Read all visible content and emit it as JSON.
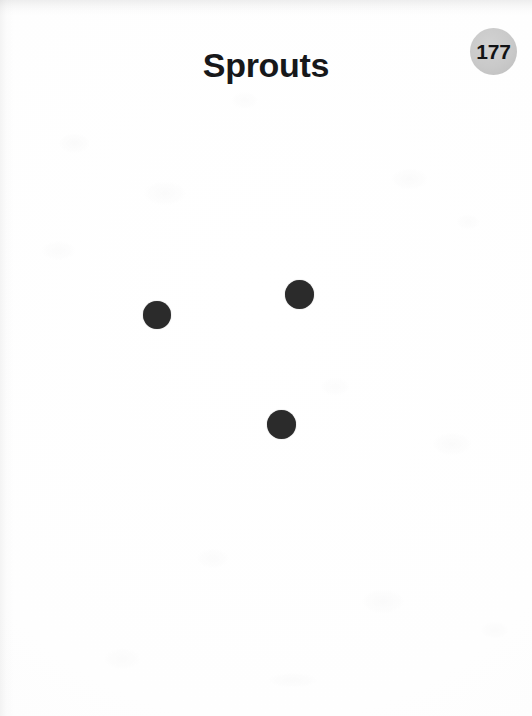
{
  "page": {
    "title": "Sprouts",
    "number": "177",
    "background_color": "#fdfdfd",
    "width": 532,
    "height": 716
  },
  "header": {
    "title": "Sprouts",
    "badge": {
      "label": "177",
      "fill_color": "#c9c9c9",
      "text_color": "#121315",
      "diameter": 47,
      "center_x": 494,
      "center_y": 51
    }
  },
  "game_board": {
    "name": "sprouts-starting-spots",
    "spot_color": "#2b2b2b",
    "spot_count": 3,
    "spots": [
      {
        "name": "spot-left",
        "x": 157,
        "y": 315,
        "diameter": 28
      },
      {
        "name": "spot-upper-right",
        "x": 299,
        "y": 294,
        "diameter": 29
      },
      {
        "name": "spot-bottom",
        "x": 281,
        "y": 424,
        "diameter": 29
      }
    ]
  }
}
